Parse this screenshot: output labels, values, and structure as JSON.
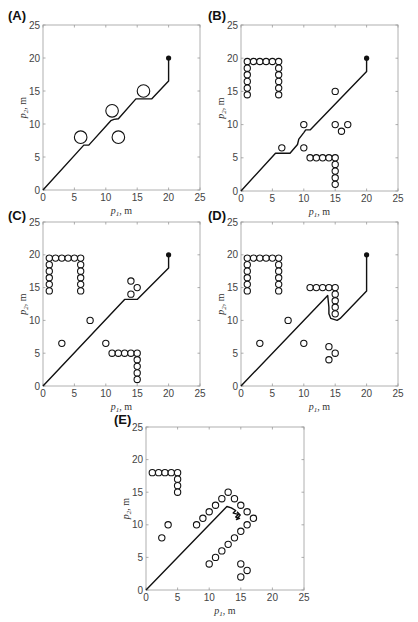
{
  "figure": {
    "panels": [
      "A",
      "B",
      "C",
      "D",
      "E"
    ]
  },
  "chart_data": [
    {
      "panel": "(A)",
      "type": "scatter",
      "xlabel": "p1, m",
      "ylabel": "p2, m",
      "xlim": [
        0,
        25
      ],
      "ylim": [
        0,
        25
      ],
      "xticks": [
        0,
        5,
        10,
        15,
        20,
        25
      ],
      "yticks": [
        0,
        5,
        10,
        15,
        20,
        25
      ],
      "grid": false,
      "goal": [
        20,
        20
      ],
      "obstacle_radius": 1.0,
      "obstacles": [
        [
          6,
          8
        ],
        [
          11,
          12
        ],
        [
          12,
          8
        ],
        [
          16,
          15
        ]
      ],
      "path": [
        [
          0,
          0
        ],
        [
          6.5,
          6.8
        ],
        [
          7.3,
          6.8
        ],
        [
          10.8,
          10.5
        ],
        [
          11.3,
          10.7
        ],
        [
          12,
          10.8
        ],
        [
          14.8,
          13.8
        ],
        [
          17.3,
          13.8
        ],
        [
          20,
          16.5
        ],
        [
          20,
          20
        ]
      ]
    },
    {
      "panel": "(B)",
      "type": "scatter",
      "xlabel": "p1, m",
      "ylabel": "p2, m",
      "xlim": [
        0,
        25
      ],
      "ylim": [
        0,
        25
      ],
      "xticks": [
        0,
        5,
        10,
        15,
        20,
        25
      ],
      "yticks": [
        0,
        5,
        10,
        15,
        20,
        25
      ],
      "grid": false,
      "goal": [
        20,
        20
      ],
      "obstacle_radius": 0.5,
      "obstacles": [
        [
          1,
          19.5
        ],
        [
          2,
          19.5
        ],
        [
          3,
          19.5
        ],
        [
          4,
          19.5
        ],
        [
          5,
          19.5
        ],
        [
          6,
          19.5
        ],
        [
          1,
          18.5
        ],
        [
          1,
          17.5
        ],
        [
          1,
          16.5
        ],
        [
          1,
          15.5
        ],
        [
          1,
          14.5
        ],
        [
          6,
          18.5
        ],
        [
          6,
          17.5
        ],
        [
          6,
          16.5
        ],
        [
          6,
          15.5
        ],
        [
          6,
          14.5
        ],
        [
          6.5,
          6.5
        ],
        [
          10,
          10
        ],
        [
          10,
          6.5
        ],
        [
          15,
          15
        ],
        [
          15,
          10
        ],
        [
          16,
          9
        ],
        [
          17,
          10
        ],
        [
          11,
          5
        ],
        [
          12,
          5
        ],
        [
          13,
          5
        ],
        [
          14,
          5
        ],
        [
          15,
          5
        ],
        [
          15,
          4
        ],
        [
          15,
          3
        ],
        [
          15,
          2
        ],
        [
          15,
          1
        ]
      ],
      "path": [
        [
          0,
          0
        ],
        [
          5.5,
          5.7
        ],
        [
          7.8,
          5.7
        ],
        [
          9,
          7
        ],
        [
          9.2,
          7.8
        ],
        [
          10,
          8.8
        ],
        [
          10.3,
          9.2
        ],
        [
          11,
          9.2
        ],
        [
          20,
          18
        ],
        [
          20,
          20
        ]
      ]
    },
    {
      "panel": "(C)",
      "type": "scatter",
      "xlabel": "p1, m",
      "ylabel": "p2, m",
      "xlim": [
        0,
        25
      ],
      "ylim": [
        0,
        25
      ],
      "xticks": [
        0,
        5,
        10,
        15,
        20,
        25
      ],
      "yticks": [
        0,
        5,
        10,
        15,
        20,
        25
      ],
      "grid": false,
      "goal": [
        20,
        20
      ],
      "obstacle_radius": 0.5,
      "obstacles": [
        [
          1,
          19.5
        ],
        [
          2,
          19.5
        ],
        [
          3,
          19.5
        ],
        [
          4,
          19.5
        ],
        [
          5,
          19.5
        ],
        [
          6,
          19.5
        ],
        [
          1,
          18.5
        ],
        [
          1,
          17.5
        ],
        [
          1,
          16.5
        ],
        [
          1,
          15.5
        ],
        [
          1,
          14.5
        ],
        [
          6,
          18.5
        ],
        [
          6,
          17.5
        ],
        [
          6,
          16.5
        ],
        [
          6,
          15.5
        ],
        [
          6,
          14.5
        ],
        [
          3,
          6.5
        ],
        [
          7.5,
          10
        ],
        [
          10,
          6.5
        ],
        [
          14,
          16
        ],
        [
          15,
          15
        ],
        [
          14,
          14
        ],
        [
          11,
          5
        ],
        [
          12,
          5
        ],
        [
          13,
          5
        ],
        [
          14,
          5
        ],
        [
          15,
          5
        ],
        [
          15,
          4
        ],
        [
          15,
          3
        ],
        [
          15,
          2
        ],
        [
          15,
          1
        ]
      ],
      "path": [
        [
          0,
          0
        ],
        [
          13,
          13.2
        ],
        [
          15,
          13.2
        ],
        [
          20,
          18
        ],
        [
          20,
          20
        ]
      ]
    },
    {
      "panel": "(D)",
      "type": "scatter",
      "xlabel": "p1, m",
      "ylabel": "p2, m",
      "xlim": [
        0,
        25
      ],
      "ylim": [
        0,
        25
      ],
      "xticks": [
        0,
        5,
        10,
        15,
        20,
        25
      ],
      "yticks": [
        0,
        5,
        10,
        15,
        20,
        25
      ],
      "grid": false,
      "goal": [
        20,
        20
      ],
      "obstacle_radius": 0.5,
      "obstacles": [
        [
          1,
          19.5
        ],
        [
          2,
          19.5
        ],
        [
          3,
          19.5
        ],
        [
          4,
          19.5
        ],
        [
          5,
          19.5
        ],
        [
          6,
          19.5
        ],
        [
          1,
          18.5
        ],
        [
          1,
          17.5
        ],
        [
          1,
          16.5
        ],
        [
          1,
          15.5
        ],
        [
          1,
          14.5
        ],
        [
          6,
          18.5
        ],
        [
          6,
          17.5
        ],
        [
          6,
          16.5
        ],
        [
          6,
          15.5
        ],
        [
          6,
          14.5
        ],
        [
          3,
          6.5
        ],
        [
          7.5,
          10
        ],
        [
          10,
          6.5
        ],
        [
          14,
          6
        ],
        [
          15,
          5
        ],
        [
          14,
          4
        ],
        [
          11,
          15
        ],
        [
          12,
          15
        ],
        [
          13,
          15
        ],
        [
          14,
          15
        ],
        [
          15,
          15
        ],
        [
          15,
          14
        ],
        [
          15,
          13
        ],
        [
          15,
          12
        ],
        [
          15,
          11
        ]
      ],
      "path": [
        [
          0,
          0
        ],
        [
          13.8,
          13.8
        ],
        [
          14.0,
          12
        ],
        [
          14.0,
          11
        ],
        [
          14.3,
          10.3
        ],
        [
          15.3,
          10
        ],
        [
          15.8,
          10.3
        ],
        [
          20,
          14.5
        ],
        [
          20,
          20
        ]
      ]
    },
    {
      "panel": "(E)",
      "type": "scatter",
      "xlabel": "p1, m",
      "ylabel": "p2, m",
      "xlim": [
        0,
        25
      ],
      "ylim": [
        0,
        25
      ],
      "xticks": [
        0,
        5,
        10,
        15,
        20,
        25
      ],
      "yticks": [
        0,
        5,
        10,
        15,
        20,
        25
      ],
      "grid": false,
      "goal": null,
      "obstacle_radius": 0.5,
      "obstacles": [
        [
          1,
          18
        ],
        [
          2,
          18
        ],
        [
          3,
          18
        ],
        [
          4,
          18
        ],
        [
          5,
          18
        ],
        [
          5,
          17
        ],
        [
          5,
          16
        ],
        [
          5,
          15
        ],
        [
          3.5,
          10
        ],
        [
          2.5,
          8
        ],
        [
          8,
          10
        ],
        [
          9,
          11
        ],
        [
          10,
          12
        ],
        [
          11,
          13
        ],
        [
          12,
          14
        ],
        [
          13,
          15
        ],
        [
          14,
          14
        ],
        [
          15,
          13
        ],
        [
          16,
          12
        ],
        [
          17,
          11
        ],
        [
          16,
          10
        ],
        [
          15,
          9
        ],
        [
          14,
          8
        ],
        [
          13,
          7
        ],
        [
          12,
          6
        ],
        [
          11,
          5
        ],
        [
          10,
          4
        ],
        [
          15,
          4
        ],
        [
          16,
          3
        ],
        [
          15,
          2
        ]
      ],
      "path": [
        [
          0,
          0
        ],
        [
          12.8,
          12.8
        ],
        [
          13.5,
          12.6
        ],
        [
          14.2,
          12.2
        ],
        [
          13.8,
          11.8
        ],
        [
          14.6,
          11.6
        ],
        [
          14.2,
          11.2
        ],
        [
          14.8,
          11.0
        ],
        [
          14.3,
          10.8
        ],
        [
          14.9,
          11.5
        ],
        [
          14.4,
          12.0
        ]
      ]
    }
  ],
  "labels": {
    "A": "(A)",
    "B": "(B)",
    "C": "(C)",
    "D": "(D)",
    "E": "(E)",
    "x_var": "p",
    "x_sub": "1",
    "y_var": "p",
    "y_sub": "2",
    "unit": ", m"
  }
}
